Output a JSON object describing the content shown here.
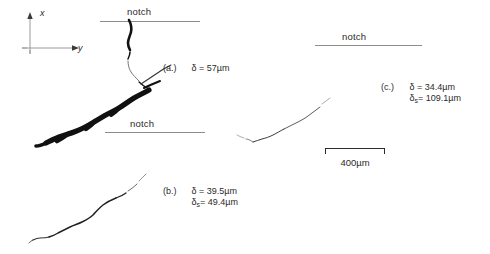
{
  "figure": {
    "type": "fracture-micrograph-figure",
    "background": "#ffffff",
    "ink_color": "#111111",
    "rule_color": "#8d8d8d"
  },
  "axes_indicator": {
    "x_label": "x",
    "y_label": "y",
    "x_direction": "up",
    "y_direction": "right"
  },
  "notches": [
    {
      "id": "notch-a",
      "label": "notch"
    },
    {
      "id": "notch-b",
      "label": "notch"
    },
    {
      "id": "notch-c",
      "label": "notch"
    }
  ],
  "panels": [
    {
      "id": "panel-a",
      "tag": "(a.)",
      "delta_line": "δ = 57µm",
      "delta_symbol": "δ",
      "delta_value": "57",
      "delta_unit": "µm",
      "has_delta_s": false,
      "crack_appearance": "thick jagged heavily-branched black crack"
    },
    {
      "id": "panel-b",
      "tag": "(b.)",
      "delta_line": "δ = 39.5µm",
      "delta_symbol": "δ",
      "delta_value": "39.5",
      "delta_unit": "µm",
      "has_delta_s": true,
      "delta_s_prefix": "δ",
      "delta_s_sub": "s",
      "delta_s_line": "= 49.4µm",
      "delta_s_value": "49.4",
      "crack_appearance": "thin smooth S-shaped crack"
    },
    {
      "id": "panel-c",
      "tag": "(c.)",
      "delta_line": "δ = 34.4µm",
      "delta_symbol": "δ",
      "delta_value": "34.4",
      "delta_unit": "µm",
      "has_delta_s": true,
      "delta_s_prefix": "δ",
      "delta_s_sub": "s",
      "delta_s_line": "= 109.1µm",
      "delta_s_value": "109.1",
      "crack_appearance": "very fine faint nearly straight crack"
    }
  ],
  "scale_bar": {
    "label": "400µm",
    "value": "400",
    "unit": "µm",
    "length_px": 60
  }
}
